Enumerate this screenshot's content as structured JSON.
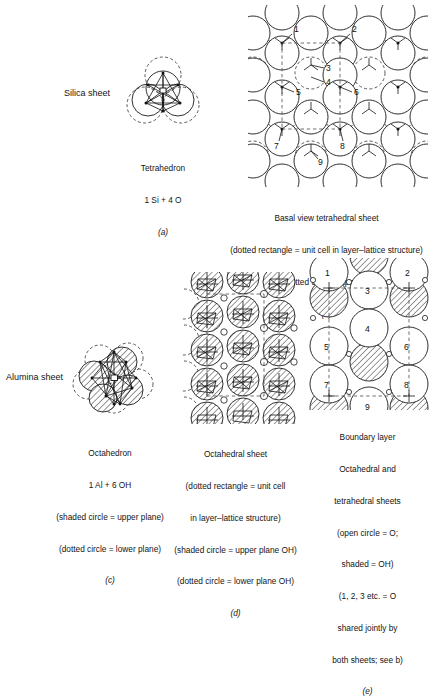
{
  "figure": {
    "background": "#ffffff",
    "ink": "#1a1a1a"
  },
  "labels": {
    "silica_sheet": "Silica sheet",
    "alumina_sheet": "Alumina sheet"
  },
  "panels": {
    "a": {
      "key": "(a)",
      "caption_lines": [
        "Tetrahedron",
        "1 Si + 4 O"
      ],
      "key_italic": "(a)"
    },
    "b": {
      "key": "(b)",
      "caption_lines": [
        "Basal view tetrahedral sheet",
        "(dotted rectangle = unit cell in layer–lattice structure)",
        "(dotted circle = apex O)"
      ],
      "key_italic": "(b)",
      "numbers": [
        "1",
        "2",
        "3",
        "4",
        "5",
        "6",
        "7",
        "8",
        "9"
      ]
    },
    "c": {
      "key": "(c)",
      "caption_lines": [
        "Octahedron",
        "1 Al + 6 OH",
        "(shaded circle = upper plane)",
        "(dotted circle = lower plane)"
      ],
      "key_italic": "(c)"
    },
    "d": {
      "key": "(d)",
      "caption_lines": [
        "Octahedral sheet",
        "(dotted rectangle = unit cell",
        "in layer–lattice structure)",
        "(shaded circle = upper plane OH)",
        "(dotted circle = lower plane OH)"
      ],
      "key_italic": "(d)"
    },
    "e": {
      "key": "(e)",
      "caption_lines": [
        "Boundary layer",
        "Octahedral and",
        "tetrahedral sheets",
        "(open circle = O;",
        "shaded = OH)",
        "(1, 2, 3 etc. = O",
        "shared jointly by",
        "both sheets; see b)"
      ],
      "key_italic": "(e)",
      "numbers": [
        "1",
        "2",
        "3",
        "4",
        "5",
        "6",
        "7",
        "8",
        "9"
      ],
      "small_marks": [
        "o",
        "o",
        "o",
        "o",
        "o",
        "o"
      ]
    }
  }
}
